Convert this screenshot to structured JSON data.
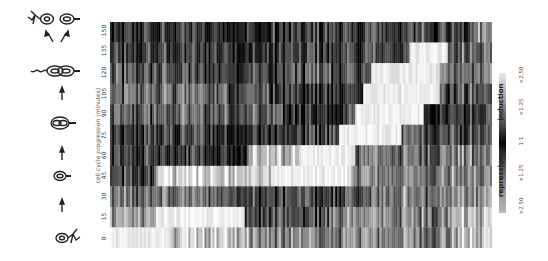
{
  "chart_data": {
    "type": "heatmap",
    "title": "",
    "ylabel": "cell cycle progression (minutes)",
    "xlabel": "",
    "orientation": "figure rotated 90 degrees; rows are time points, columns are genes",
    "rows": [
      "150",
      "135",
      "120",
      "105",
      "90",
      "75",
      "60",
      "45",
      "30",
      "15",
      "0"
    ],
    "yticks": [
      "0",
      "15",
      "30",
      "45",
      "60",
      "75",
      "90",
      "105",
      "120",
      "135",
      "150"
    ],
    "n_columns_approx": 190,
    "colormap": "grayscale (dark = near 1:1, light = strong induction or repression)",
    "legend": {
      "induction_label": "induction",
      "repression_label": "repression",
      "ticks": [
        "×2.50",
        "×1.25",
        "1:1",
        "×1.25",
        "×2.50"
      ]
    },
    "row_profiles": [
      {
        "row": "150",
        "segments": [
          [
            0,
            0.15
          ],
          [
            0.42,
            0.2
          ],
          [
            0.78,
            0.3
          ],
          [
            0.95,
            0.55
          ]
        ]
      },
      {
        "row": "135",
        "segments": [
          [
            0,
            0.2
          ],
          [
            0.5,
            0.25
          ],
          [
            0.78,
            0.95
          ],
          [
            0.88,
            0.35
          ]
        ]
      },
      {
        "row": "120",
        "segments": [
          [
            0,
            0.25
          ],
          [
            0.45,
            0.3
          ],
          [
            0.68,
            0.95
          ],
          [
            0.86,
            0.45
          ]
        ]
      },
      {
        "row": "105",
        "segments": [
          [
            0,
            0.4
          ],
          [
            0.42,
            0.15
          ],
          [
            0.66,
            0.95
          ],
          [
            0.86,
            0.3
          ]
        ]
      },
      {
        "row": "90",
        "segments": [
          [
            0,
            0.35
          ],
          [
            0.45,
            0.15
          ],
          [
            0.64,
            0.95
          ],
          [
            0.82,
            0.25
          ]
        ]
      },
      {
        "row": "75",
        "segments": [
          [
            0,
            0.2
          ],
          [
            0.52,
            0.25
          ],
          [
            0.6,
            0.9
          ],
          [
            0.76,
            0.3
          ]
        ]
      },
      {
        "row": "60",
        "segments": [
          [
            0,
            0.2
          ],
          [
            0.36,
            0.75
          ],
          [
            0.5,
            0.95
          ],
          [
            0.64,
            0.45
          ]
        ]
      },
      {
        "row": "45",
        "segments": [
          [
            0,
            0.2
          ],
          [
            0.12,
            0.85
          ],
          [
            0.42,
            0.9
          ],
          [
            0.63,
            0.5
          ]
        ]
      },
      {
        "row": "30",
        "segments": [
          [
            0,
            0.4
          ],
          [
            0.35,
            0.3
          ],
          [
            0.52,
            0.2
          ],
          [
            0.68,
            0.5
          ],
          [
            0.9,
            0.5
          ]
        ]
      },
      {
        "row": "15",
        "segments": [
          [
            0,
            0.6
          ],
          [
            0.12,
            0.95
          ],
          [
            0.35,
            0.3
          ],
          [
            0.58,
            0.5
          ],
          [
            0.88,
            0.7
          ]
        ]
      },
      {
        "row": "0",
        "segments": [
          [
            0,
            1.0
          ],
          [
            0.15,
            0.75
          ],
          [
            0.36,
            0.5
          ],
          [
            0.9,
            0.7
          ]
        ]
      }
    ]
  },
  "icons": {
    "stages": [
      "swarmer cell with flagellum and pili",
      "stalked cell",
      "predivisional cell",
      "late predivisional cell with flagellum",
      "daughter cells: swarmer and stalked"
    ]
  }
}
